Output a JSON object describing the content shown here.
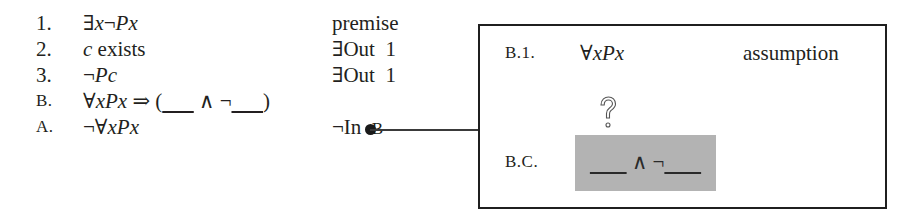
{
  "proof": {
    "lines": [
      {
        "num": "1.",
        "formula_parts": [
          "∃",
          "x",
          "¬",
          "P",
          "x"
        ],
        "formula": "∃x¬Px",
        "justification": "premise"
      },
      {
        "num": "2.",
        "formula": "c exists",
        "justification": "∃Out  1"
      },
      {
        "num": "3.",
        "formula": "¬Pc",
        "justification": "∃Out  1"
      },
      {
        "num": "B.",
        "formula": "∀xPx ⇒ (___ ∧ ¬___)",
        "justification": ""
      },
      {
        "num": "A.",
        "formula": "¬∀xPx",
        "justification_rule": "¬In",
        "justification_ref": "B"
      }
    ]
  },
  "subproof": {
    "assumption": {
      "label": "B.1.",
      "formula": "∀xPx",
      "justification": "assumption"
    },
    "open_gap_icon": "question-mark-outline-icon",
    "conclusion": {
      "label": "B.C.",
      "formula": "___ ∧ ¬___"
    },
    "highlight_color": "#b3b3b3",
    "border_color": "#1f1f1f"
  },
  "connector": {
    "from_line": "B.",
    "dot_color": "#1a1a1a"
  }
}
